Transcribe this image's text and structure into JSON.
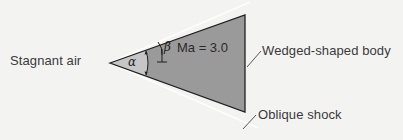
{
  "diagram": {
    "labels": {
      "stagnant_air": "Stagnant air",
      "wedge_body": "Wedged-shaped body",
      "oblique_shock": "Oblique shock",
      "mach": "Ma = 3.0",
      "alpha": "α",
      "beta": "β"
    },
    "colors": {
      "background": "#f3f3f2",
      "wedge_fill": "#9a9a9a",
      "wedge_tip_fill": "#c4c4c4",
      "wedge_outline": "#222222",
      "shock_line": "#ffffff",
      "text": "#3a3a3a"
    },
    "geometry": {
      "tip": [
        110,
        63
      ],
      "top_back": [
        245,
        15
      ],
      "bottom_back": [
        245,
        112
      ]
    }
  }
}
